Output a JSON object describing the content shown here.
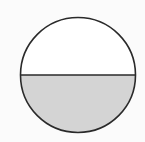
{
  "diagram": {
    "type": "circle-half-shaded",
    "shaded_fraction": "1/2",
    "shaded_part": "bottom",
    "colors": {
      "background": "#fbfbfb",
      "stroke": "#2a2a2a",
      "shade": "#d4d4d4",
      "unshaded": "#ffffff"
    }
  }
}
